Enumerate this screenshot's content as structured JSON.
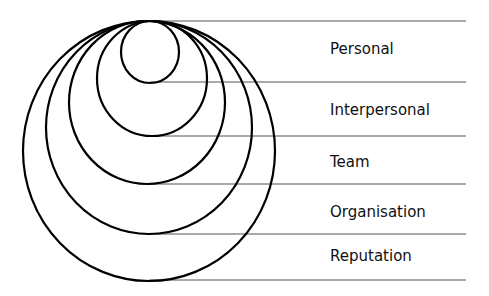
{
  "diagram": {
    "title": "",
    "levels": [
      {
        "label": "Personal",
        "ellipse": {
          "cx": 150,
          "cy": 52,
          "rx": 29,
          "ry": 31
        },
        "line_y": 82,
        "label_y": 49
      },
      {
        "label": "Interpersonal",
        "ellipse": {
          "cx": 152,
          "cy": 78.5,
          "rx": 55,
          "ry": 57.5
        },
        "line_y": 136,
        "label_y": 110
      },
      {
        "label": "Team",
        "ellipse": {
          "cx": 147,
          "cy": 102.5,
          "rx": 78,
          "ry": 81.5
        },
        "line_y": 184,
        "label_y": 162
      },
      {
        "label": "Organisation",
        "ellipse": {
          "cx": 149,
          "cy": 127.5,
          "rx": 103,
          "ry": 106.5
        },
        "line_y": 234,
        "label_y": 212
      },
      {
        "label": "Reputation",
        "ellipse": {
          "cx": 149,
          "cy": 151,
          "rx": 126,
          "ry": 130
        },
        "line_y": 280,
        "label_y": 256
      }
    ],
    "top_line_y": 21,
    "line_start_x": 150,
    "line_end_x": 466,
    "label_x": 330,
    "stroke_color": "#000000",
    "line_color": "#555555"
  }
}
